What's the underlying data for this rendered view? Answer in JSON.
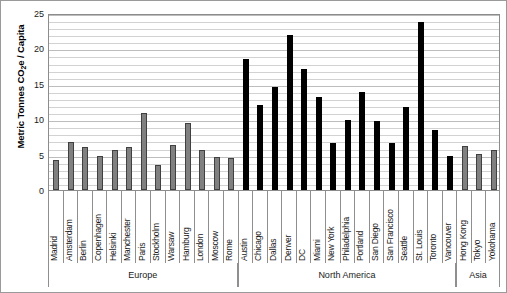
{
  "chart_data": {
    "type": "bar",
    "title": "",
    "xlabel": "",
    "ylabel": "Metric Tonnes CO2e / Capita",
    "ylabel_parts": {
      "pre": "Metric Tonnes CO",
      "sub": "2",
      "post": "e / Capita"
    },
    "ylim": [
      0,
      25
    ],
    "ytick_labels": [
      "0",
      "5",
      "10",
      "15",
      "20",
      "25"
    ],
    "ytick_values": [
      0,
      5,
      10,
      15,
      20,
      25
    ],
    "grid": true,
    "grid_minor_step": 1,
    "legend": "none",
    "categories": [
      "Madrid",
      "Amsterdam",
      "Berlin",
      "Copenhagen",
      "Helsinki",
      "Manchester",
      "Paris",
      "Stockholm",
      "Warsaw",
      "Hamburg",
      "London",
      "Moscow",
      "Rome",
      "Austin",
      "Chicago",
      "Dallas",
      "Denver",
      "DC",
      "Miami",
      "New York",
      "Philadelphia",
      "Portland",
      "San Diego",
      "San Francisco",
      "Seattle",
      "St. Louis",
      "Toronto",
      "Vancouver",
      "Hong Kong",
      "Tokyo",
      "Yokohama"
    ],
    "values": [
      4.2,
      6.8,
      6.1,
      4.8,
      5.6,
      6.1,
      10.9,
      3.6,
      6.3,
      9.5,
      5.6,
      4.6,
      4.5,
      18.5,
      12.0,
      14.5,
      21.9,
      17.1,
      13.2,
      6.7,
      9.9,
      13.8,
      9.8,
      6.7,
      11.7,
      23.8,
      8.5,
      4.8,
      6.2,
      5.1,
      5.7
    ],
    "bar_colors": [
      "#808080",
      "#808080",
      "#808080",
      "#808080",
      "#808080",
      "#808080",
      "#808080",
      "#808080",
      "#808080",
      "#808080",
      "#808080",
      "#808080",
      "#808080",
      "#000000",
      "#000000",
      "#000000",
      "#000000",
      "#000000",
      "#000000",
      "#000000",
      "#000000",
      "#000000",
      "#000000",
      "#000000",
      "#000000",
      "#000000",
      "#000000",
      "#000000",
      "#808080",
      "#808080",
      "#808080"
    ],
    "regions": [
      {
        "label": "Europe",
        "start_index": 0,
        "end_index": 12,
        "color": "#808080"
      },
      {
        "label": "North America",
        "start_index": 13,
        "end_index": 27,
        "color": "#000000"
      },
      {
        "label": "Asia",
        "start_index": 28,
        "end_index": 30,
        "color": "#808080"
      }
    ],
    "colors": {
      "europe_bar": "#808080",
      "north_america_bar": "#000000",
      "asia_bar": "#808080",
      "gridline": "#d2d2d2",
      "axis": "#8c8c8c",
      "text": "#1a1a1a"
    }
  }
}
